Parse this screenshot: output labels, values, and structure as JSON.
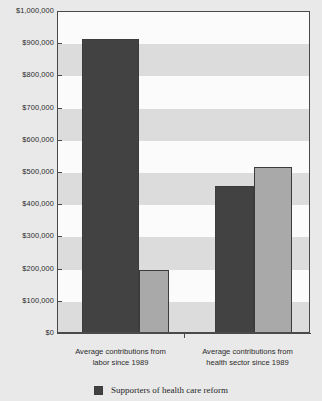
{
  "chart_data": {
    "type": "bar",
    "title": "",
    "xlabel": "",
    "ylabel": "",
    "categories": [
      "Average contributions from labor since 1989",
      "Average contributions from health sector since 1989"
    ],
    "series": [
      {
        "name": "Supporters of health care reform",
        "color": "#424242",
        "values": [
          915000,
          460000
        ]
      },
      {
        "name": "",
        "color": "#a9a9a9",
        "values": [
          200000,
          520000
        ]
      }
    ],
    "ylim": [
      0,
      1000000
    ],
    "ytick_step": 100000,
    "grid": false,
    "banded_background": true,
    "legend_position": "bottom"
  },
  "axis": {
    "y_ticks": [
      {
        "value": 1000000,
        "label": "$1,000,000"
      },
      {
        "value": 900000,
        "label": "$900,000"
      },
      {
        "value": 800000,
        "label": "$800,000"
      },
      {
        "value": 700000,
        "label": "$700,000"
      },
      {
        "value": 600000,
        "label": "$600,000"
      },
      {
        "value": 500000,
        "label": "$500,000"
      },
      {
        "value": 400000,
        "label": "$400,000"
      },
      {
        "value": 300000,
        "label": "$300,000"
      },
      {
        "value": 200000,
        "label": "$200,000"
      },
      {
        "value": 100000,
        "label": "$100,000"
      },
      {
        "value": 0,
        "label": "$0"
      }
    ]
  },
  "categories": [
    {
      "line1": "Average contributions from",
      "line2": "labor since 1989"
    },
    {
      "line1": "Average contributions from",
      "line2": "health sector since 1989"
    }
  ],
  "legend": {
    "items": [
      {
        "label": "Supporters of health care reform",
        "color": "#424242"
      }
    ]
  },
  "colors": {
    "dark_bar": "#424242",
    "light_bar": "#a9a9a9",
    "band": "#dcdcdc",
    "plot_background": "#fbfbfb",
    "page_background": "#e9e9e9",
    "axis": "#4a4a4a"
  }
}
